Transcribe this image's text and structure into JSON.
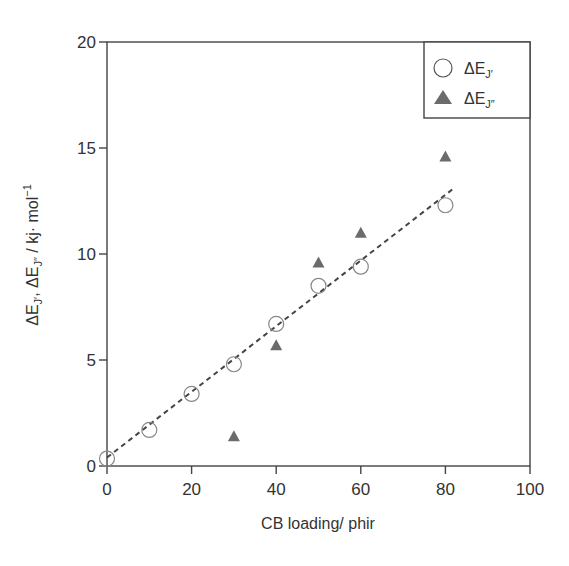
{
  "chart_data": {
    "type": "scatter",
    "title": "",
    "xlabel": "CB loading/ phir",
    "ylabel": "ΔE_J′, ΔE_J″ / kj· mol⁻¹",
    "xlim": [
      0,
      100
    ],
    "ylim": [
      0,
      20
    ],
    "xticks": [
      0,
      20,
      40,
      60,
      80,
      100
    ],
    "yticks": [
      0,
      5,
      10,
      15,
      20
    ],
    "grid": false,
    "legend_position": "upper right",
    "series": [
      {
        "name": "ΔE_J′",
        "marker": "open-circle",
        "x": [
          0,
          10,
          20,
          30,
          40,
          50,
          60,
          80
        ],
        "y": [
          0.35,
          1.7,
          3.4,
          4.8,
          6.7,
          8.5,
          9.4,
          12.3
        ]
      },
      {
        "name": "ΔE_J″",
        "marker": "filled-triangle",
        "x": [
          30,
          40,
          50,
          60,
          80
        ],
        "y": [
          1.4,
          5.7,
          9.6,
          11.0,
          14.6
        ]
      }
    ],
    "fit_line": {
      "style": "dashed",
      "x": [
        0,
        82
      ],
      "y": [
        0.4,
        13.1
      ]
    }
  },
  "labels": {
    "xlabel": "CB loading/ phir",
    "ylabel_prefix": "ΔE",
    "legend": [
      {
        "prefix": "ΔE",
        "sub": "J′"
      },
      {
        "prefix": "ΔE",
        "sub": "J″"
      }
    ]
  },
  "colors": {
    "axis": "#444444",
    "circle_stroke": "#888888",
    "triangle_fill": "#6b6b6b",
    "fit_line": "#444444"
  }
}
